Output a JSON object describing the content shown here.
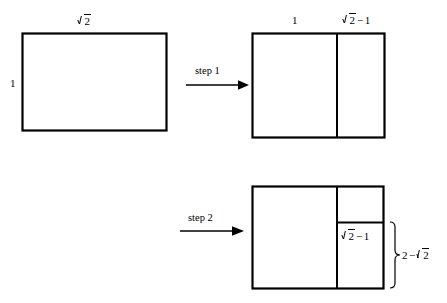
{
  "figure": {
    "type": "geometric-construction-diagram",
    "background_color": "#ffffff",
    "line_color": "#000000"
  },
  "steps": [
    {
      "id": "step1",
      "label": "step 1"
    },
    {
      "id": "step2",
      "label": "step 2"
    }
  ],
  "panels": {
    "start": {
      "name": "starting-rectangle",
      "width_label": {
        "sqrt": "2",
        "text": "√2"
      },
      "height_label": {
        "text": "1"
      }
    },
    "after_step1": {
      "name": "rectangle-after-step-1",
      "left_part_label": {
        "text": "1"
      },
      "right_part_label": {
        "sqrt": "2",
        "op": "−",
        "term": "1",
        "text": "√2 − 1"
      }
    },
    "after_step2": {
      "name": "rectangle-after-step-2",
      "inner_label": {
        "sqrt": "2",
        "op": "−",
        "term": "1",
        "text": "√2 − 1"
      },
      "brace_label": {
        "lead": "2",
        "op": "−",
        "sqrt": "2",
        "text": "2 − √2"
      }
    }
  }
}
